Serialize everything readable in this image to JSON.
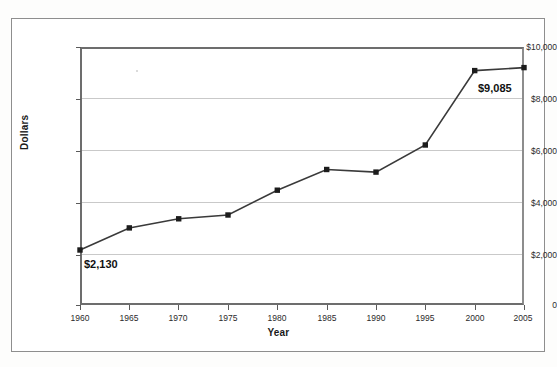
{
  "chart_data": {
    "type": "line",
    "title": "",
    "xlabel": "Year",
    "ylabel": "Dollars",
    "x": [
      1960,
      1965,
      1970,
      1975,
      1980,
      1985,
      1990,
      1995,
      2000,
      2005
    ],
    "categories": [
      "1960",
      "1965",
      "1970",
      "1975",
      "1980",
      "1985",
      "1990",
      "1995",
      "2000",
      "2005"
    ],
    "values": [
      2130,
      2990,
      3340,
      3490,
      4450,
      5250,
      5150,
      6200,
      9085,
      9200
    ],
    "series": [
      {
        "name": "Dollars",
        "values": [
          2130,
          2990,
          3340,
          3490,
          4450,
          5250,
          5150,
          6200,
          9085,
          9200
        ]
      }
    ],
    "xlim": [
      1960,
      2005
    ],
    "ylim": [
      0,
      10000
    ],
    "ytick_labels": [
      "$10,000",
      "$8,000",
      "$6,000",
      "$4,000",
      "$2,000",
      "0"
    ],
    "ytick_values": [
      10000,
      8000,
      6000,
      4000,
      2000,
      0
    ],
    "xtick_labels": [
      "1960",
      "1965",
      "1970",
      "1975",
      "1980",
      "1985",
      "1990",
      "1995",
      "2000",
      "2005"
    ],
    "grid": "horizontal",
    "legend": "none",
    "marker": "square",
    "line_color": "#3a3a3a",
    "marker_color": "#1c1c1c",
    "grid_color": "#c9c9c9",
    "annotations": [
      {
        "text": "$2,130",
        "x": 1960,
        "y": 2130,
        "position": "below-right"
      },
      {
        "text": "$9,085",
        "x": 2000,
        "y": 9085,
        "position": "below-right"
      }
    ]
  },
  "axis": {
    "y_title": "Dollars",
    "x_title": "Year"
  }
}
